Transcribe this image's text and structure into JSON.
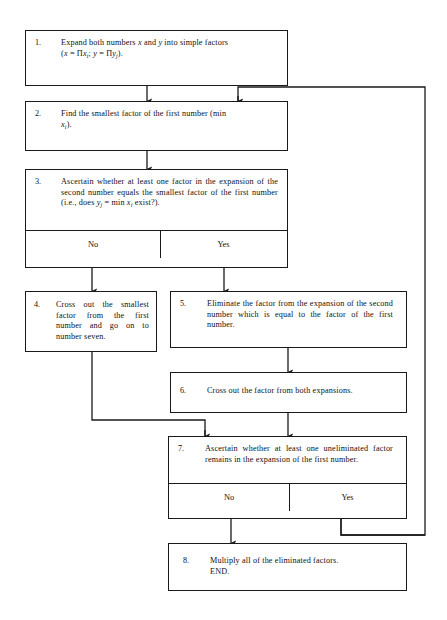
{
  "diagram": {
    "line_color": "#1a1a1a",
    "background": "#ffffff",
    "nodes": [
      {
        "id": "step1",
        "number": "1.",
        "text_line1_a": "Expand both numbers ",
        "text_line1_x": "x",
        "text_line1_b": " and ",
        "text_line1_y": "y",
        "text_line1_c": " into simple factors",
        "formula_open": "(",
        "formula_x": "x",
        "formula_eq1": " = Π",
        "formula_xi_base": "x",
        "formula_xi_sub": "i",
        "formula_semi": "; ",
        "formula_y": "y",
        "formula_eq2": " = Π",
        "formula_yj_base": "y",
        "formula_yj_sub": "j",
        "formula_close": ")."
      },
      {
        "id": "step2",
        "number": "2.",
        "text_a": "Find the smallest factor of the first number (min",
        "text_b_base": "x",
        "text_b_sub": "i",
        "text_b_close": ")."
      },
      {
        "id": "step3",
        "number": "3.",
        "text_a": "Ascertain whether at least one factor in the expansion of the second number equals the smallest factor of the first number (i.e., does ",
        "text_yj_base": "y",
        "text_yj_sub": "j",
        "text_b": " = min ",
        "text_xi_base": "x",
        "text_xi_sub": "i",
        "text_c": " exist?).",
        "answer_no": "No",
        "answer_yes": "Yes"
      },
      {
        "id": "step4",
        "number": "4.",
        "text": "Cross out the smallest factor from the first number and go on to number seven."
      },
      {
        "id": "step5",
        "number": "5.",
        "text": "Eliminate the factor from the expansion of the second number which is equal to the factor of the first number."
      },
      {
        "id": "step6",
        "number": "6.",
        "text": "Cross out the factor from both expansions."
      },
      {
        "id": "step7",
        "number": "7.",
        "text": "Ascertain whether at least one uneliminated factor remains in the expansion of the first number.",
        "answer_no": "No",
        "answer_yes": "Yes"
      },
      {
        "id": "step8",
        "number": "8.",
        "text_line1": "Multiply all of the eliminated factors.",
        "text_line2": "END."
      }
    ]
  }
}
